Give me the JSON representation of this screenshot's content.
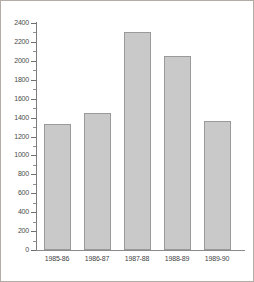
{
  "chart_data": {
    "type": "bar",
    "title": "",
    "subtitle": "",
    "xlabel": "",
    "ylabel": "",
    "categories": [
      "1985-86",
      "1986-87",
      "1987-88",
      "1988-89",
      "1989-90"
    ],
    "values": [
      1330,
      1450,
      2310,
      2050,
      1360
    ],
    "series": [
      {
        "name": "",
        "values": [
          1330,
          1450,
          2310,
          2050,
          1360
        ]
      }
    ],
    "ylim": [
      0,
      2400
    ],
    "ytick_step": 200,
    "yticks": [
      0,
      200,
      400,
      600,
      800,
      1000,
      1200,
      1400,
      1600,
      1800,
      2000,
      2200,
      2400
    ],
    "ytick_labels": [
      "0",
      "200",
      "400",
      "600",
      "800",
      "1000",
      "1200",
      "1400",
      "1600",
      "1800",
      "2000",
      "2200",
      "2400"
    ],
    "grid": false,
    "legend": null,
    "legend_position": "none",
    "bar_color": "#c9c9c9",
    "bar_border_color": "#9a9a9a",
    "axis_color": "#7d7d7d",
    "frame_color": "#b4ada6",
    "background_color": "#ffffff",
    "minor_ticks": true
  }
}
